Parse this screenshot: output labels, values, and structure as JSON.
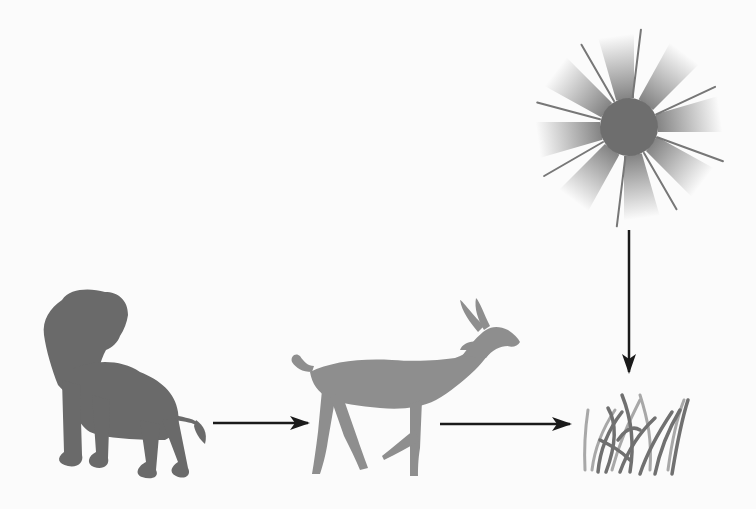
{
  "diagram": {
    "type": "food-chain",
    "colors": {
      "background": "#fbfbfb",
      "sun": "#6e6e6e",
      "lion": "#6a6a6a",
      "antelope": "#8e8e8e",
      "grass_dark": "#707070",
      "grass_light": "#a8a8a8",
      "arrow": "#1a1a1a"
    },
    "nodes": [
      {
        "id": "sun",
        "label": "sun",
        "icon": "sun-icon"
      },
      {
        "id": "grass",
        "label": "grass",
        "icon": "grass-icon"
      },
      {
        "id": "antelope",
        "label": "antelope",
        "icon": "antelope-icon"
      },
      {
        "id": "lion",
        "label": "lion",
        "icon": "lion-icon"
      }
    ],
    "edges": [
      {
        "from": "sun",
        "to": "grass",
        "direction": "down"
      },
      {
        "from": "antelope",
        "to": "grass",
        "direction": "right"
      },
      {
        "from": "lion",
        "to": "antelope",
        "direction": "right"
      }
    ]
  }
}
